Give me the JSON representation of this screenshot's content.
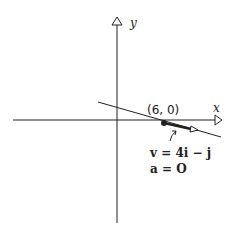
{
  "axes": {
    "x_label": "x",
    "y_label": "y"
  },
  "point": {
    "label": "(6, 0)",
    "x": 6,
    "y": 0
  },
  "annotation": {
    "velocity": "v = 4i − j",
    "acceleration": "a = O"
  },
  "colors": {
    "ink": "#222222",
    "background": "#ffffff"
  }
}
